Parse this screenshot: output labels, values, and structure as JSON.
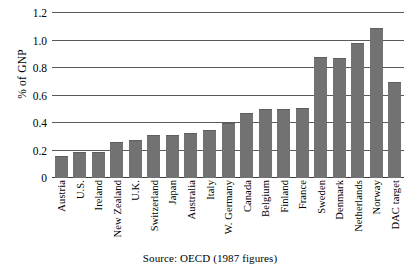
{
  "chart_data": {
    "type": "bar",
    "title": "",
    "xlabel": "",
    "ylabel": "% of GNP",
    "ylim": [
      0,
      1.2
    ],
    "yticks": [
      "0",
      "0.2",
      "0.4",
      "0.6",
      "0.8",
      "1.0",
      "1.2"
    ],
    "ytick_values": [
      0,
      0.2,
      0.4,
      0.6,
      0.8,
      1.0,
      1.2
    ],
    "grid": true,
    "legend": "none",
    "bar_color": "#727272",
    "categories": [
      "Austria",
      "U.S.",
      "Ireland",
      "New Zealand",
      "U.K.",
      "Switzerland",
      "Japan",
      "Australia",
      "Italy",
      "W. Germany",
      "Canada",
      "Belgium",
      "Finland",
      "France",
      "Sweden",
      "Denmark",
      "Netherlands",
      "Norway",
      "DAC target"
    ],
    "values": [
      0.16,
      0.19,
      0.19,
      0.26,
      0.28,
      0.31,
      0.31,
      0.33,
      0.35,
      0.4,
      0.47,
      0.5,
      0.5,
      0.51,
      0.88,
      0.87,
      0.98,
      1.09,
      0.7
    ],
    "annotations": {
      "source": "Source: OECD (1987 figures)"
    }
  }
}
